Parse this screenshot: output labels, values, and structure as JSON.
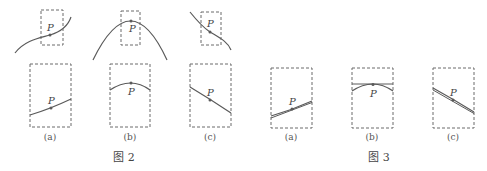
{
  "figure2": {
    "caption": "图 2",
    "point_label": "P",
    "panels": [
      {
        "id": "a",
        "caption": "(a)"
      },
      {
        "id": "b",
        "caption": "(b)"
      },
      {
        "id": "c",
        "caption": "(c)"
      }
    ]
  },
  "figure3": {
    "caption": "图 3",
    "point_label": "P",
    "panels": [
      {
        "id": "a",
        "caption": "(a)"
      },
      {
        "id": "b",
        "caption": "(b)"
      },
      {
        "id": "c",
        "caption": "(c)"
      }
    ]
  },
  "colors": {
    "stroke": "#5a5a5a",
    "dashed_box": "#6b6b6b",
    "text": "#444444",
    "background": "#ffffff"
  }
}
